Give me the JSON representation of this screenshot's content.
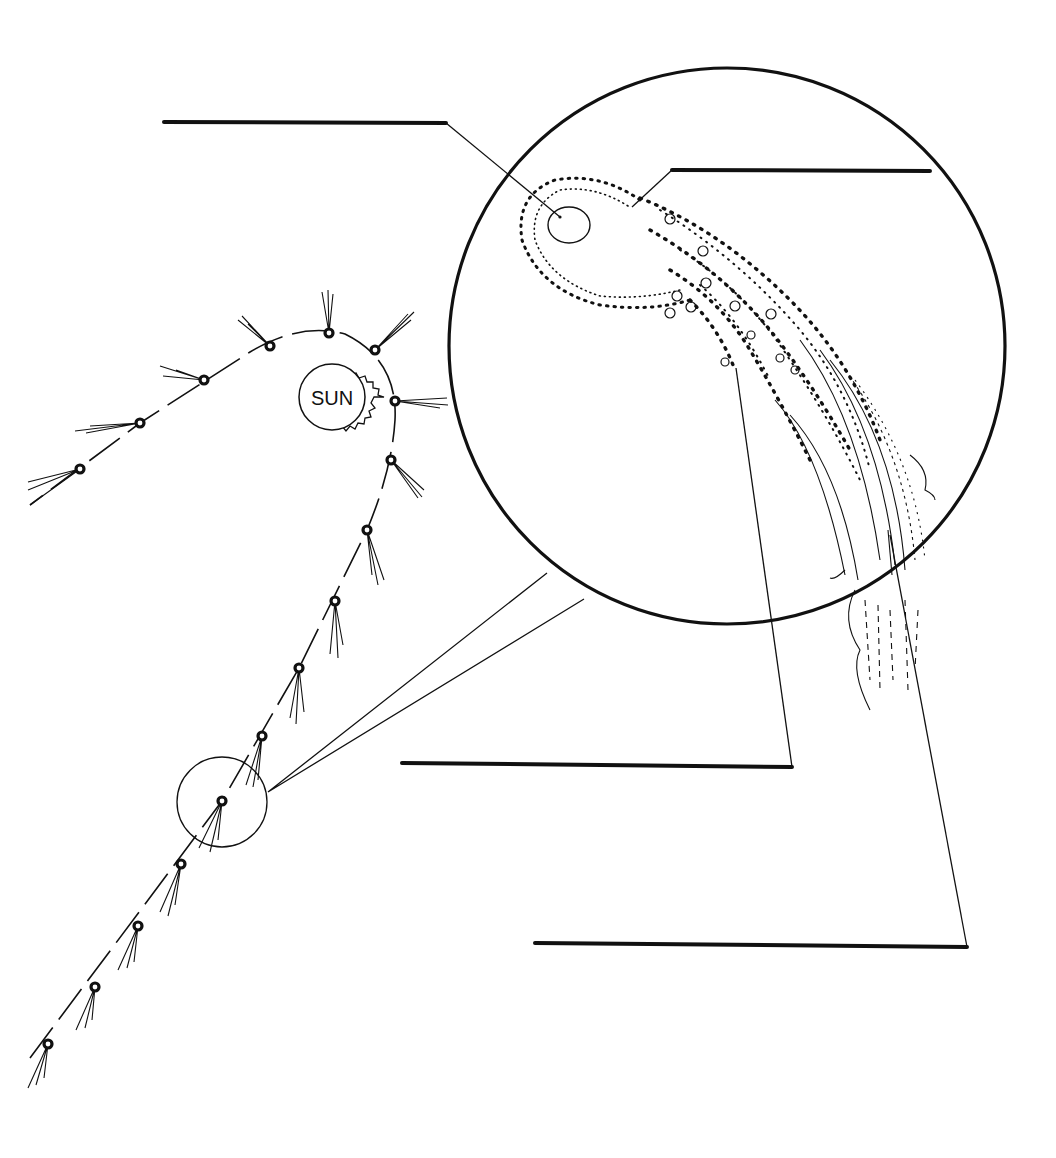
{
  "diagram": {
    "sun": {
      "label": "SUN",
      "cx": 332,
      "cy": 397,
      "r": 36
    },
    "label_blanks": [
      {
        "id": "blank-1",
        "points_to": "nucleus",
        "text": ""
      },
      {
        "id": "blank-2",
        "points_to": "coma",
        "text": ""
      },
      {
        "id": "blank-3",
        "points_to": "dust-tail",
        "text": ""
      },
      {
        "id": "blank-4",
        "points_to": "ion-tail",
        "text": ""
      }
    ],
    "comet_positions": [
      {
        "x": 48,
        "y": 1044
      },
      {
        "x": 95,
        "y": 987
      },
      {
        "x": 138,
        "y": 926
      },
      {
        "x": 181,
        "y": 864
      },
      {
        "x": 222,
        "y": 801
      },
      {
        "x": 262,
        "y": 736
      },
      {
        "x": 299,
        "y": 668
      },
      {
        "x": 335,
        "y": 601
      },
      {
        "x": 367,
        "y": 530
      },
      {
        "x": 391,
        "y": 460
      },
      {
        "x": 395,
        "y": 401
      },
      {
        "x": 375,
        "y": 350
      },
      {
        "x": 329,
        "y": 333
      },
      {
        "x": 270,
        "y": 346
      },
      {
        "x": 204,
        "y": 380
      },
      {
        "x": 140,
        "y": 423
      },
      {
        "x": 80,
        "y": 469
      }
    ],
    "magnifier": {
      "small": {
        "cx": 222,
        "cy": 802,
        "r": 45
      },
      "large": {
        "cx": 727,
        "cy": 346,
        "r": 278
      }
    },
    "colors": {
      "ink": "#111111",
      "paper": "#ffffff"
    }
  }
}
